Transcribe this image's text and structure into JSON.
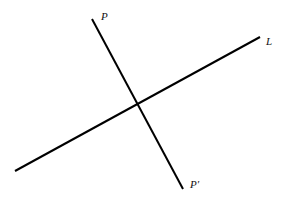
{
  "diagram": {
    "type": "geometry-lines",
    "lines": [
      {
        "id": "P-Pprime",
        "x1": 92,
        "y1": 19,
        "x2": 183,
        "y2": 189,
        "color": "#000000",
        "width": 2
      },
      {
        "id": "L",
        "x1": 15,
        "y1": 171,
        "x2": 260,
        "y2": 37,
        "color": "#000000",
        "width": 2
      }
    ],
    "labels": {
      "p": {
        "text": "P",
        "x": 101,
        "y": 20
      },
      "l": {
        "text": "L",
        "x": 266,
        "y": 45
      },
      "p_prime": {
        "text": "P′",
        "x": 190,
        "y": 188
      }
    },
    "intersection": {
      "x": 138,
      "y": 102
    }
  }
}
